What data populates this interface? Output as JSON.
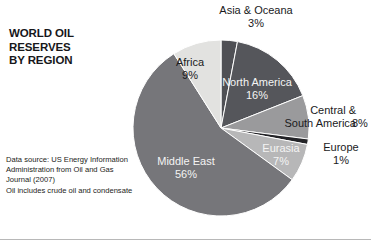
{
  "title": "WORLD OIL RESERVES\nBY REGION",
  "source_note": "Data source: US Energy Information Administration from Oil and Gas Journal (2007)\nOil includes crude oil and condensate",
  "labels": {
    "asia": "Asia & Oceana\n3%",
    "africa": "Africa\n9%",
    "north_america": "North America\n16%",
    "central_south_america": "Central &\nSouth America",
    "central_south_america_pct": "8%",
    "europe": "Europe\n1%",
    "eurasia": "Eurasia\n7%",
    "middle_east": "Middle East\n56%"
  },
  "chart_data": {
    "type": "pie",
    "title": "WORLD OIL RESERVES BY REGION",
    "unit": "percent of world oil reserves",
    "start_angle_deg": 0,
    "direction": "clockwise",
    "categories": [
      "Asia & Oceana",
      "North America",
      "Central & South America",
      "Europe",
      "Eurasia",
      "Middle East",
      "Africa"
    ],
    "values": [
      3,
      16,
      8,
      1,
      7,
      56,
      9
    ],
    "total": 100,
    "slices": [
      {
        "label": "Asia & Oceana",
        "value": 3,
        "display": "3%",
        "color": "#4f5055",
        "label_color": "#1a1a1c",
        "label_placement": "outside-top"
      },
      {
        "label": "North America",
        "value": 16,
        "display": "16%",
        "color": "#55565b",
        "label_color": "#f4f4f4",
        "label_placement": "inside"
      },
      {
        "label": "Central & South America",
        "value": 8,
        "display": "8%",
        "color": "#9a9a9c",
        "label_color": "#1a1a1c",
        "label_placement": "outside-right"
      },
      {
        "label": "Europe",
        "value": 1,
        "display": "1%",
        "color": "#232327",
        "label_color": "#1a1a1c",
        "label_placement": "outside-right"
      },
      {
        "label": "Eurasia",
        "value": 7,
        "display": "7%",
        "color": "#b7b7b8",
        "label_color": "#f4f4f4",
        "label_placement": "inside"
      },
      {
        "label": "Middle East",
        "value": 56,
        "display": "56%",
        "color": "#76767a",
        "label_color": "#f4f4f4",
        "label_placement": "inside"
      },
      {
        "label": "Africa",
        "value": 9,
        "display": "9%",
        "color": "#e2e2e0",
        "label_color": "#1a1a1c",
        "label_placement": "inside"
      }
    ],
    "legend": "none",
    "grid": false,
    "source": "US Energy Information Administration from Oil and Gas Journal (2007)"
  }
}
